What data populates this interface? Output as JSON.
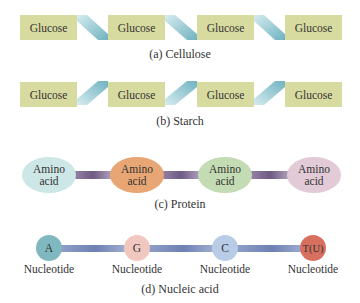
{
  "cellulose": {
    "units": [
      "Glucose",
      "Glucose",
      "Glucose",
      "Glucose"
    ],
    "caption": "(a) Cellulose",
    "unit_color": "#d8dba0",
    "link_color": "#8ec4cf"
  },
  "starch": {
    "units": [
      "Glucose",
      "Glucose",
      "Glucose",
      "Glucose"
    ],
    "caption": "(b) Starch",
    "unit_color": "#d8dba0",
    "link_color": "#8ec4cf"
  },
  "protein": {
    "units": [
      {
        "line1": "Amino",
        "line2": "acid",
        "color": "#cde6e6"
      },
      {
        "line1": "Amino",
        "line2": "acid",
        "color": "#e8a674"
      },
      {
        "line1": "Amino",
        "line2": "acid",
        "color": "#c4dcb4"
      },
      {
        "line1": "Amino",
        "line2": "acid",
        "color": "#e2cad6"
      }
    ],
    "caption": "(c) Protein",
    "link_color": "#7a6690"
  },
  "nucleic_acid": {
    "units": [
      {
        "base": "A",
        "label": "Nucleotide",
        "color": "#7fb8c0"
      },
      {
        "base": "G",
        "label": "Nucleotide",
        "color": "#f0c8c0"
      },
      {
        "base": "C",
        "label": "Nucleotide",
        "color": "#b8cce8"
      },
      {
        "base": "T(U)",
        "label": "Nucleotide",
        "color": "#d87060"
      }
    ],
    "caption": "(d) Nucleic acid",
    "link_color": "#7b8cbc"
  }
}
